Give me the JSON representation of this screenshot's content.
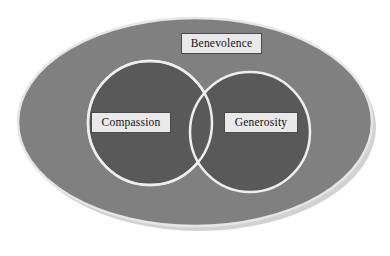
{
  "diagram": {
    "type": "venn",
    "canvas": {
      "width": 390,
      "height": 256,
      "background": "#ffffff"
    },
    "sets": [
      {
        "id": "benevolence",
        "label": "Benevolence",
        "role": "universe",
        "shape": "ellipse",
        "fill": "#808080",
        "stroke": "#e6e6e6",
        "center_x": 195,
        "center_y": 122,
        "radius_x": 177,
        "radius_y": 104
      },
      {
        "id": "compassion",
        "label": "Compassion",
        "role": "subset",
        "shape": "circle",
        "fill": "#595959",
        "stroke": "#eeeeee",
        "center_x": 150,
        "center_y": 123,
        "radius": 62
      },
      {
        "id": "generosity",
        "label": "Generosity",
        "role": "subset",
        "shape": "circle",
        "fill": "#595959",
        "stroke": "#eeeeee",
        "center_x": 250,
        "center_y": 132,
        "radius": 60
      }
    ],
    "labels": {
      "benevolence": "Benevolence",
      "compassion": "Compassion",
      "generosity": "Generosity"
    },
    "label_style": {
      "background": "#e9e9e9",
      "border_color": "#4a4a4a",
      "text_color": "#111111"
    },
    "shadow": {
      "color": "#d2d2d2",
      "offset_x": 4,
      "offset_y": 5
    }
  }
}
